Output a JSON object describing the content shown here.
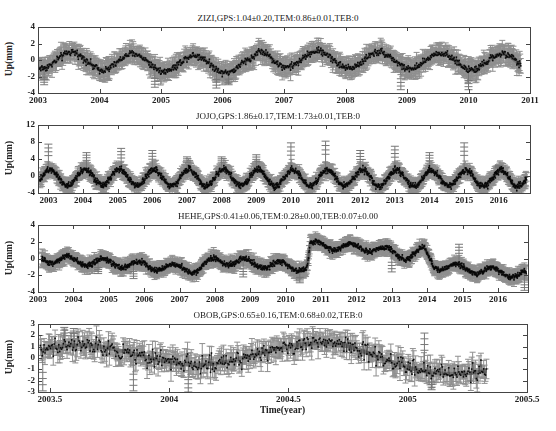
{
  "chart_data": [
    {
      "type": "line",
      "station": "ZIZI",
      "title": "ZIZI,GPS:1.04±0.20,TEM:0.86±0.01,TEB:0",
      "ylabel": "Up(mm)",
      "xlabel": "",
      "xlim": [
        2003,
        2011
      ],
      "ylim": [
        -4,
        4
      ],
      "yticks": [
        -4,
        -2,
        0,
        2,
        4
      ],
      "xticks": [
        2003,
        2004,
        2005,
        2006,
        2007,
        2008,
        2009,
        2010,
        2011
      ],
      "frame": {
        "left": 38,
        "top": 27,
        "right": 530,
        "bottom": 93
      },
      "series": [
        {
          "name": "GPS observations (with error bars)",
          "color": "#111111",
          "errorbar_color": "#8a8a8a"
        },
        {
          "name": "TEM model",
          "color": "#7a7a7a"
        }
      ],
      "model": {
        "x_start": 2003.0,
        "x_end": 2010.85,
        "amplitude": 1.0,
        "phase_peak": 0.55,
        "trend_segments": [
          [
            2003.0,
            0.0
          ],
          [
            2006.5,
            -0.6
          ],
          [
            2006.6,
            0.2
          ],
          [
            2010.85,
            -0.3
          ]
        ],
        "noise": 0.45,
        "err": 1.1,
        "spikes": [
          [
            2003.1,
            -3
          ],
          [
            2004.9,
            -3.3
          ],
          [
            2005.9,
            -3.4
          ],
          [
            2006.1,
            -3
          ],
          [
            2008.9,
            -3.6
          ],
          [
            2010.0,
            -3.6
          ]
        ]
      }
    },
    {
      "type": "line",
      "station": "JOJO",
      "title": "JOJO,GPS:1.86±0.17,TEM:1.73±0.01,TEB:0",
      "ylabel": "Up(mm)",
      "xlabel": "",
      "xlim": [
        2002.7,
        2016.9
      ],
      "ylim": [
        -4,
        12
      ],
      "yticks": [
        -4,
        0,
        4,
        8,
        12
      ],
      "xticks": [
        2003,
        2004,
        2005,
        2006,
        2007,
        2008,
        2009,
        2010,
        2011,
        2012,
        2013,
        2014,
        2015,
        2016
      ],
      "frame": {
        "left": 38,
        "top": 125,
        "right": 530,
        "bottom": 193
      },
      "series": [
        {
          "name": "GPS observations (with error bars)",
          "color": "#111111",
          "errorbar_color": "#8a8a8a"
        },
        {
          "name": "TEM model",
          "color": "#7a7a7a"
        }
      ],
      "model": {
        "x_start": 2002.75,
        "x_end": 2016.8,
        "amplitude": 1.9,
        "phase_peak": 0.05,
        "trend_segments": [
          [
            2002.75,
            -0.3
          ],
          [
            2016.8,
            -0.6
          ]
        ],
        "noise": 0.8,
        "err": 1.4,
        "spikes": [
          [
            2003.0,
            7.5
          ],
          [
            2004.1,
            5.5
          ],
          [
            2005.1,
            6.5
          ],
          [
            2006.0,
            6
          ],
          [
            2007.0,
            4.5
          ],
          [
            2008.0,
            4.5
          ],
          [
            2009.0,
            5
          ],
          [
            2010.0,
            7.8
          ],
          [
            2011.0,
            8.2
          ],
          [
            2012.0,
            6
          ],
          [
            2013.0,
            7
          ],
          [
            2014.0,
            5.5
          ],
          [
            2015.0,
            7.8
          ],
          [
            2016.0,
            2.5
          ]
        ]
      }
    },
    {
      "type": "line",
      "station": "HEHE",
      "title": "HEHE,GPS:0.41±0.06,TEM:0.28±0.00,TEB:0.07±0.00",
      "ylabel": "Up(mm)",
      "xlabel": "",
      "xlim": [
        2003,
        2016.85
      ],
      "ylim": [
        -4,
        4
      ],
      "yticks": [
        -4,
        -2,
        0,
        2,
        4
      ],
      "xticks": [
        2003,
        2004,
        2005,
        2006,
        2007,
        2008,
        2009,
        2010,
        2011,
        2012,
        2013,
        2014,
        2015,
        2016
      ],
      "frame": {
        "left": 38,
        "top": 225,
        "right": 528,
        "bottom": 292
      },
      "series": [
        {
          "name": "GPS observations (with error bars)",
          "color": "#111111",
          "errorbar_color": "#8a8a8a"
        },
        {
          "name": "TEM model",
          "color": "#7a7a7a"
        }
      ],
      "model": {
        "x_start": 2003.1,
        "x_end": 2016.8,
        "amplitude": 0.45,
        "phase_peak": 0.85,
        "trend_segments": [
          [
            2003.1,
            0.0
          ],
          [
            2007.5,
            -1.3
          ],
          [
            2008.0,
            -0.2
          ],
          [
            2010.6,
            -1.1
          ],
          [
            2010.7,
            1.6
          ],
          [
            2012.5,
            1.2
          ],
          [
            2013.5,
            0.2
          ],
          [
            2013.9,
            1.0
          ],
          [
            2014.2,
            -0.8
          ],
          [
            2016.8,
            -2.0
          ]
        ],
        "noise": 0.35,
        "err": 0.75,
        "spikes": [
          [
            2004.7,
            -1.8
          ],
          [
            2005.7,
            -2.4
          ],
          [
            2008.8,
            -2.2
          ],
          [
            2010.4,
            -2.9
          ],
          [
            2013.0,
            -1.6
          ],
          [
            2014.9,
            1.7
          ],
          [
            2016.75,
            -3.8
          ]
        ]
      }
    },
    {
      "type": "line",
      "station": "OBOB",
      "title": "OBOB,GPS:0.65±0.16,TEM:0.68±0.02,TEB:0",
      "ylabel": "Up(mm)",
      "xlabel": "Time(year)",
      "xlim": [
        2003.45,
        2005.5
      ],
      "ylim": [
        -3,
        3
      ],
      "yticks": [
        -3,
        -2,
        -1,
        0,
        1,
        2,
        3
      ],
      "xticks": [
        2003.5,
        2004,
        2004.5,
        2005,
        2005.5
      ],
      "frame": {
        "left": 38,
        "top": 324,
        "right": 527,
        "bottom": 392
      },
      "series": [
        {
          "name": "GPS observations (with error bars)",
          "color": "#111111",
          "errorbar_color": "#8a8a8a"
        },
        {
          "name": "TEM model",
          "color": "#7a7a7a"
        }
      ],
      "model": {
        "x_start": 2003.46,
        "x_end": 2005.33,
        "amplitude": 0.9,
        "phase_peak": 0.62,
        "trend_segments": [
          [
            2003.46,
            0.2
          ],
          [
            2004.75,
            0.4
          ],
          [
            2005.33,
            -0.9
          ]
        ],
        "noise": 0.75,
        "err": 0.9,
        "spikes": [
          [
            2003.47,
            -2.9
          ],
          [
            2003.56,
            2.7
          ],
          [
            2003.6,
            2.6
          ],
          [
            2003.85,
            -2.9
          ],
          [
            2004.08,
            -3
          ],
          [
            2005.07,
            2.2
          ],
          [
            2005.1,
            -2.8
          ]
        ]
      }
    }
  ]
}
